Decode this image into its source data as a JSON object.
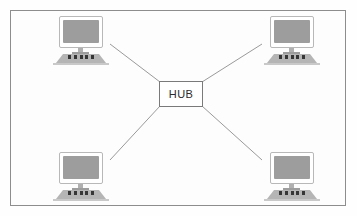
{
  "diagram": {
    "type": "star-network-topology",
    "frame": {
      "border_color": "#8d8d8d",
      "background_color": "#fdfdfd"
    },
    "hub": {
      "label": "HUB",
      "border_color": "#7a7a7a",
      "fill_color": "#ffffff",
      "text_color": "#2b2b2b",
      "x": 159,
      "y": 81,
      "width": 44,
      "height": 26
    },
    "link_color": "#9a9a9a",
    "nodes": [
      {
        "id": "workstation-top-left",
        "label": "",
        "icon": "desktop-computer-icon",
        "position": "top-left",
        "x": 50,
        "y": 16,
        "screen_color": "#9d9d9d",
        "key_count": 5
      },
      {
        "id": "workstation-top-right",
        "label": "",
        "icon": "desktop-computer-icon",
        "position": "top-right",
        "x": 261,
        "y": 16,
        "screen_color": "#9d9d9d",
        "key_count": 5
      },
      {
        "id": "workstation-bottom-left",
        "label": "",
        "icon": "desktop-computer-icon",
        "position": "bottom-left",
        "x": 50,
        "y": 152,
        "screen_color": "#9d9d9d",
        "key_count": 5
      },
      {
        "id": "workstation-bottom-right",
        "label": "",
        "icon": "desktop-computer-icon",
        "position": "bottom-right",
        "x": 261,
        "y": 152,
        "screen_color": "#9d9d9d",
        "key_count": 5
      }
    ],
    "links": [
      {
        "id": "link-hub-top-left",
        "from": "hub",
        "to": "workstation-top-left",
        "x1": 160,
        "y1": 82,
        "x2": 110,
        "y2": 44
      },
      {
        "id": "link-hub-top-right",
        "from": "hub",
        "to": "workstation-top-right",
        "x1": 202,
        "y1": 82,
        "x2": 262,
        "y2": 44
      },
      {
        "id": "link-hub-bottom-left",
        "from": "hub",
        "to": "workstation-bottom-left",
        "x1": 160,
        "y1": 106,
        "x2": 110,
        "y2": 160
      },
      {
        "id": "link-hub-bottom-right",
        "from": "hub",
        "to": "workstation-bottom-right",
        "x1": 202,
        "y1": 106,
        "x2": 262,
        "y2": 160
      }
    ]
  }
}
